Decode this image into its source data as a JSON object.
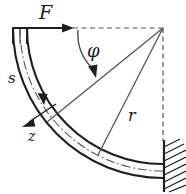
{
  "figure": {
    "labels": {
      "force": "F",
      "angle": "φ",
      "arc_coordinate": "s",
      "normal_coordinate": "z",
      "radius": "r"
    },
    "icon_names": {
      "force_arrow": "force-arrow-icon",
      "angle_arc_arrow": "angle-arc-arrow-icon",
      "s_direction_arrow": "s-direction-arrow-icon",
      "z_direction_arrow": "z-direction-arrow-icon",
      "wall_hatching": "fixed-support-hatching-icon",
      "centerline": "dash-dot-centerline-icon"
    },
    "colors": {
      "ink": "#1e1e1e",
      "thin_ink": "#55555a",
      "background": "#ffffff"
    },
    "geometry": {
      "center_x": 163,
      "center_y": 28,
      "outer_radius": 150,
      "inner_radius": 136,
      "mid_radius": 143,
      "sweep_start_deg": 180,
      "sweep_end_deg": 90,
      "phi_ray_deg": 141,
      "r_ray_deg": 116
    }
  }
}
